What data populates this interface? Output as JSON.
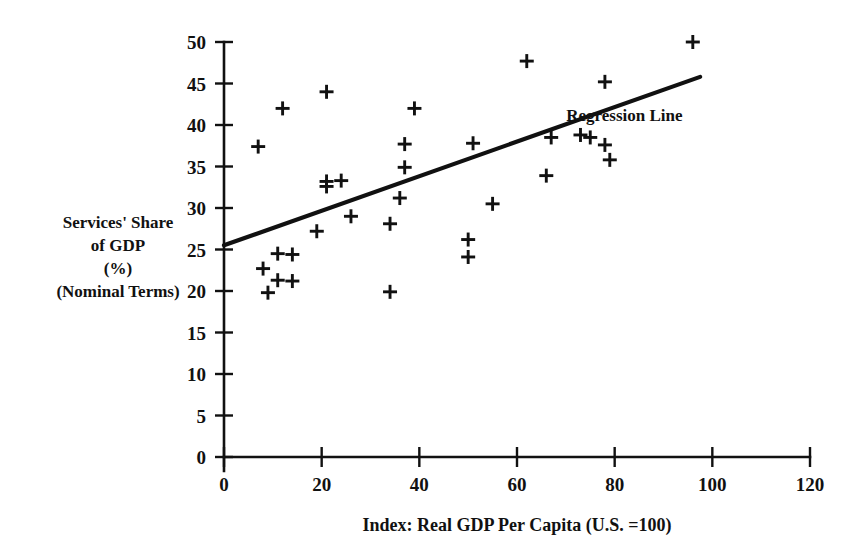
{
  "chart_data": {
    "type": "scatter",
    "title": "",
    "xlabel": "Index:  Real GDP Per Capita (U.S. =100)",
    "ylabel": "Services' Share of GDP (%) (Nominal Terms)",
    "ylabel_lines": [
      "Services' Share",
      "of GDP",
      "(%)",
      "(Nominal Terms)"
    ],
    "xlim": [
      0,
      120
    ],
    "ylim": [
      0,
      50
    ],
    "xticks": [
      0,
      20,
      40,
      60,
      80,
      100,
      120
    ],
    "yticks": [
      0,
      5,
      10,
      15,
      20,
      25,
      30,
      35,
      40,
      45,
      50
    ],
    "xtick_labels": [
      "0",
      "20",
      "40",
      "60",
      "80",
      "100",
      "120"
    ],
    "ytick_labels": [
      "0",
      "5",
      "10",
      "15",
      "20",
      "25",
      "30",
      "35",
      "40",
      "45",
      "50"
    ],
    "grid": false,
    "legend_position": "inline-annotation",
    "marker_symbol": "plus",
    "marker_color": "#111111",
    "points": [
      {
        "x": 7,
        "y": 37.4
      },
      {
        "x": 12,
        "y": 42.0
      },
      {
        "x": 8,
        "y": 22.7
      },
      {
        "x": 11,
        "y": 24.5
      },
      {
        "x": 14,
        "y": 24.4
      },
      {
        "x": 11,
        "y": 21.3
      },
      {
        "x": 14,
        "y": 21.2
      },
      {
        "x": 9,
        "y": 19.8
      },
      {
        "x": 21,
        "y": 44.0
      },
      {
        "x": 21,
        "y": 33.2
      },
      {
        "x": 21,
        "y": 32.6
      },
      {
        "x": 24,
        "y": 33.3
      },
      {
        "x": 19,
        "y": 27.2
      },
      {
        "x": 26,
        "y": 29.0
      },
      {
        "x": 34,
        "y": 28.1
      },
      {
        "x": 34,
        "y": 19.9
      },
      {
        "x": 37,
        "y": 37.7
      },
      {
        "x": 37,
        "y": 34.9
      },
      {
        "x": 39,
        "y": 42.0
      },
      {
        "x": 36,
        "y": 31.2
      },
      {
        "x": 50,
        "y": 26.2
      },
      {
        "x": 50,
        "y": 24.1
      },
      {
        "x": 51,
        "y": 37.8
      },
      {
        "x": 55,
        "y": 30.5
      },
      {
        "x": 62,
        "y": 47.7
      },
      {
        "x": 66,
        "y": 33.9
      },
      {
        "x": 67,
        "y": 38.5
      },
      {
        "x": 73,
        "y": 38.8
      },
      {
        "x": 75,
        "y": 38.5
      },
      {
        "x": 78,
        "y": 45.2
      },
      {
        "x": 78,
        "y": 37.6
      },
      {
        "x": 79,
        "y": 35.8
      },
      {
        "x": 96,
        "y": 50.0
      }
    ],
    "regression_line": {
      "label": "Regression Line",
      "x_start": 0,
      "y_start": 25.5,
      "x_end": 97.5,
      "y_end": 45.8,
      "label_x": 82,
      "label_y": 40.5
    }
  }
}
